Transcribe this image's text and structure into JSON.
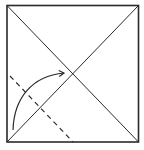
{
  "diagram": {
    "colors": {
      "background": "#ffffff",
      "line": "#2a2a2a",
      "fold_line": "#2a2a2a"
    },
    "elements": [
      {
        "kind": "paper-square",
        "label": "square sheet"
      },
      {
        "kind": "crease",
        "label": "diagonal crease top-left to bottom-right"
      },
      {
        "kind": "crease",
        "label": "diagonal crease bottom-left to top-right"
      },
      {
        "kind": "valley-fold-line",
        "label": "dashed fold line"
      },
      {
        "kind": "fold-arrow",
        "label": "fold bottom-left corner to center"
      }
    ]
  }
}
